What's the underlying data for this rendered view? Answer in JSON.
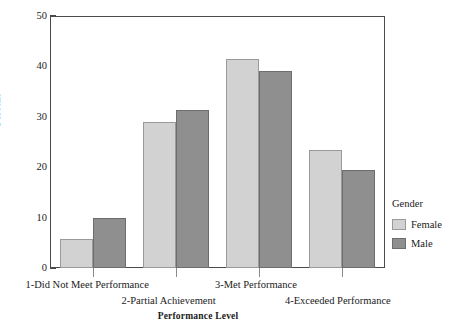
{
  "chart_data": {
    "type": "bar",
    "title": "",
    "xlabel": "Performance Level",
    "ylabel": "Percent",
    "categories": [
      "1-Did Not Meet Performance",
      "2-Partial Achievement",
      "3-Met Performance",
      "4-Exceeded Performance"
    ],
    "series": [
      {
        "name": "Female",
        "color": "#d2d2d2",
        "values": [
          5.8,
          29.0,
          41.5,
          23.5
        ]
      },
      {
        "name": "Male",
        "color": "#8f8f8f",
        "values": [
          10.0,
          31.3,
          39.0,
          19.5
        ]
      }
    ],
    "ylim": [
      0,
      50
    ],
    "yticks": [
      0,
      10,
      20,
      30,
      40,
      50
    ],
    "ytick_labels": [
      "0",
      "10",
      "20",
      "30",
      "40",
      "50"
    ],
    "grid": false,
    "legend_position": "right",
    "legend_title": "Gender"
  },
  "legend": {
    "title": "Gender",
    "entries": [
      {
        "label": "Female",
        "color": "#d2d2d2"
      },
      {
        "label": "Male",
        "color": "#8f8f8f"
      }
    ]
  },
  "axes": {
    "y_title": "Percent",
    "x_title": "Performance Level"
  }
}
